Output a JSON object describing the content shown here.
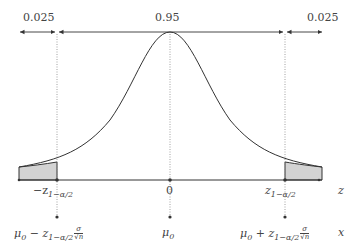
{
  "diagram": {
    "type": "normal-distribution-two-sided-test",
    "probabilities": {
      "left_tail": "0.025",
      "center": "0.95",
      "right_tail": "0.025"
    },
    "z_axis": {
      "label": "z",
      "left_critical": "−z",
      "left_critical_sub": "1−α/2",
      "center": "0",
      "right_critical": "z",
      "right_critical_sub": "1−α/2"
    },
    "x_axis": {
      "label": "x",
      "left": "μ",
      "left_sub": "0",
      "left_op": " − z",
      "left_op_sub": "1−α/2",
      "center": "μ",
      "center_sub": "0",
      "right": "μ",
      "right_sub": "0",
      "right_op": " + z",
      "right_op_sub": "1−α/2",
      "frac_num": "σ",
      "frac_den": "√n"
    },
    "colors": {
      "line": "#333333",
      "shade": "#d3d3d3",
      "dotted": "#888888"
    }
  }
}
